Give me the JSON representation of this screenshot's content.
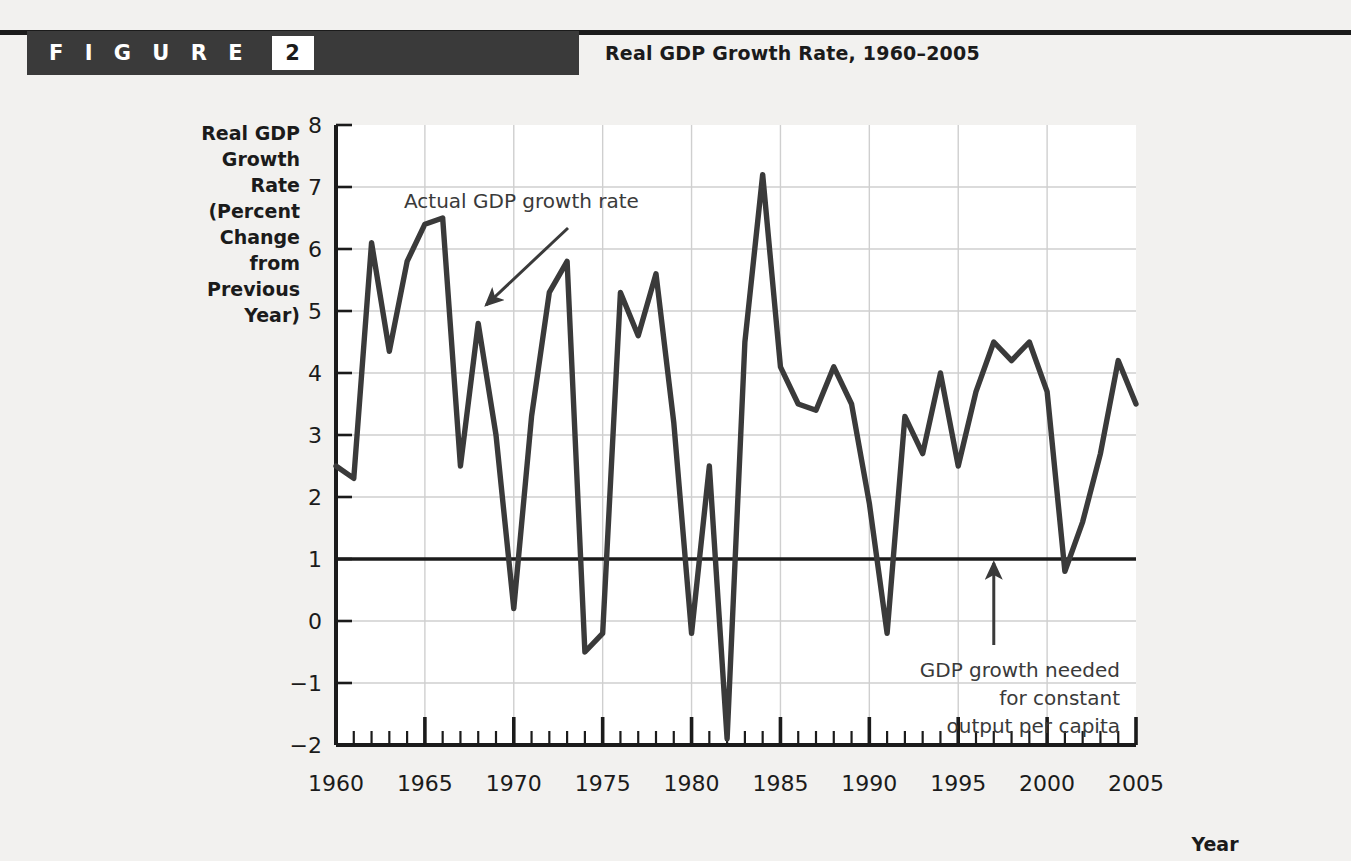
{
  "figure": {
    "label": "F I G U R E",
    "number": "2",
    "title": "Real GDP Growth Rate, 1960–2005"
  },
  "chart_data": {
    "type": "line",
    "title": "Real GDP Growth Rate, 1960–2005",
    "xlabel": "Year",
    "ylabel": "Real GDP Growth Rate (Percent Change from Previous Year)",
    "ylabel_lines": [
      "Real GDP",
      "Growth",
      "Rate",
      "(Percent",
      "Change",
      "from",
      "Previous",
      "Year)"
    ],
    "xlim": [
      1960,
      2005
    ],
    "ylim": [
      -2,
      8
    ],
    "yticks": [
      -2,
      -1,
      0,
      1,
      2,
      3,
      4,
      5,
      6,
      7,
      8
    ],
    "ytick_labels": [
      "−2",
      "−1",
      "0",
      "1",
      "2",
      "3",
      "4",
      "5",
      "6",
      "7",
      "8"
    ],
    "xticks_major": [
      1960,
      1965,
      1970,
      1975,
      1980,
      1985,
      1990,
      1995,
      2000,
      2005
    ],
    "xtick_labels": [
      "1960",
      "1965",
      "1970",
      "1975",
      "1980",
      "1985",
      "1990",
      "1995",
      "2000",
      "2005"
    ],
    "xtick_minor_step": 1,
    "grid": true,
    "legend_position": "none",
    "series": [
      {
        "name": "Actual GDP growth rate",
        "x": [
          1960,
          1961,
          1962,
          1963,
          1964,
          1965,
          1966,
          1967,
          1968,
          1969,
          1970,
          1971,
          1972,
          1973,
          1974,
          1975,
          1976,
          1977,
          1978,
          1979,
          1980,
          1981,
          1982,
          1983,
          1984,
          1985,
          1986,
          1987,
          1988,
          1989,
          1990,
          1991,
          1992,
          1993,
          1994,
          1995,
          1996,
          1997,
          1998,
          1999,
          2000,
          2001,
          2002,
          2003,
          2004,
          2005
        ],
        "values": [
          2.5,
          2.3,
          6.1,
          4.35,
          5.8,
          6.4,
          6.5,
          2.5,
          4.8,
          3.0,
          0.2,
          3.3,
          5.3,
          5.8,
          -0.5,
          -0.2,
          5.3,
          4.6,
          5.6,
          3.2,
          -0.2,
          2.5,
          -1.9,
          4.5,
          7.2,
          4.1,
          3.5,
          3.4,
          4.1,
          3.5,
          1.9,
          -0.2,
          3.3,
          2.7,
          4.0,
          2.5,
          3.7,
          4.5,
          4.2,
          4.5,
          3.7,
          0.8,
          1.6,
          2.7,
          4.2,
          3.5
        ]
      }
    ],
    "reference_line": {
      "label": "GDP growth needed for constant output per capita",
      "value": 1.0
    },
    "annotations": [
      {
        "name": "actual-gdp-growth-rate",
        "text": "Actual GDP growth rate",
        "points_to_year": 1968,
        "points_to_value": 5.0
      },
      {
        "name": "gdp-growth-needed",
        "lines": [
          "GDP growth needed",
          "for constant",
          "output per capita"
        ],
        "points_to_year": 1997,
        "points_to_value": 1.0
      }
    ]
  },
  "colors": {
    "page_background": "#f2f1ef",
    "plot_background": "#ffffff",
    "banner": "#3a3a3a",
    "rule": "#1b1b1b",
    "line": "#3a3a3a",
    "grid": "#cfcfcf",
    "axis": "#1b1b1b"
  }
}
